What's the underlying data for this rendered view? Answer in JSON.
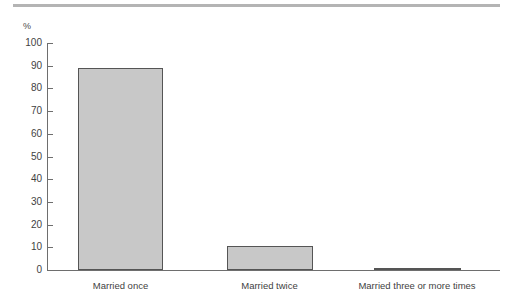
{
  "chart_data": {
    "type": "bar",
    "title": "",
    "subtitle": "",
    "xlabel": "",
    "ylabel": "%",
    "unit_label": "%",
    "categories": [
      "Married once",
      "Married twice",
      "Married three or more times"
    ],
    "values": [
      89.2,
      10.4,
      1.0
    ],
    "series": [
      {
        "name": "Percentage",
        "values": [
          89.2,
          10.4,
          1.0
        ]
      }
    ],
    "ylim": [
      0,
      100
    ],
    "ytick_step": 10,
    "ytick_labels": [
      "100",
      "90",
      "80",
      "70",
      "60",
      "50",
      "40",
      "30",
      "20",
      "10",
      "0"
    ],
    "ytick_values": [
      100,
      90,
      80,
      70,
      60,
      50,
      40,
      30,
      20,
      10,
      0
    ],
    "grid": false,
    "legend": false,
    "legend_position": "none",
    "colors": {
      "bar_fill": "#c8c8c8",
      "bar_edge": "#555555",
      "axis": "#6e6e6e",
      "text": "#3f3f3f",
      "top_rule": "#b4b4b4",
      "background": "#ffffff"
    }
  }
}
